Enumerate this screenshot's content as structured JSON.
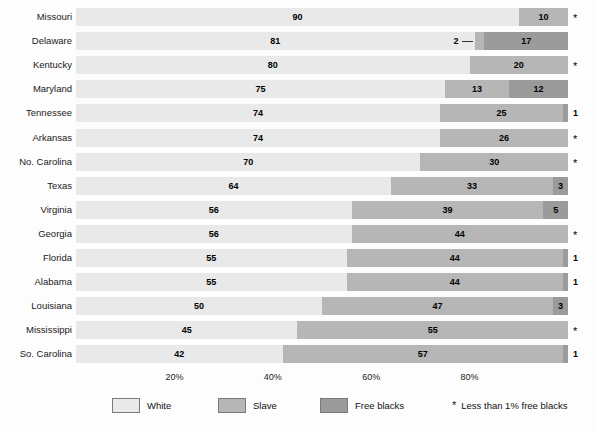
{
  "chart_data": {
    "type": "bar",
    "subtype": "stacked-horizontal-100pct",
    "title": "",
    "xlabel": "",
    "ylabel": "",
    "xlim": [
      0,
      100
    ],
    "grid": false,
    "legend_position": "bottom",
    "categories": [
      "Missouri",
      "Delaware",
      "Kentucky",
      "Maryland",
      "Tennessee",
      "Arkansas",
      "No. Carolina",
      "Texas",
      "Virginia",
      "Georgia",
      "Florida",
      "Alabama",
      "Louisiana",
      "Mississippi",
      "So. Carolina"
    ],
    "series": [
      {
        "name": "White",
        "color": "#e9e9e9",
        "values": [
          90,
          81,
          80,
          75,
          74,
          74,
          70,
          64,
          56,
          56,
          55,
          55,
          50,
          45,
          42
        ]
      },
      {
        "name": "Slave",
        "color": "#b6b6b6",
        "values": [
          10,
          2,
          20,
          13,
          25,
          26,
          30,
          33,
          39,
          44,
          44,
          44,
          47,
          55,
          57
        ]
      },
      {
        "name": "Free blacks",
        "color": "#9b9b9b",
        "values": [
          0,
          17,
          0,
          12,
          1,
          0,
          0,
          3,
          5,
          0,
          1,
          1,
          3,
          0,
          1
        ]
      }
    ],
    "x_ticks": [
      "20%",
      "40%",
      "60%",
      "80%"
    ],
    "x_tick_values": [
      20,
      40,
      60,
      80
    ],
    "rows": [
      {
        "label": "Missouri",
        "white": 90,
        "slave": 10,
        "free": 0,
        "white_label": "90",
        "slave_label": "10",
        "free_label": "",
        "end_marker": "*",
        "slave_callout": false
      },
      {
        "label": "Delaware",
        "white": 81,
        "slave": 2,
        "free": 17,
        "white_label": "81",
        "slave_label": "2",
        "free_label": "17",
        "end_marker": "",
        "slave_callout": true
      },
      {
        "label": "Kentucky",
        "white": 80,
        "slave": 20,
        "free": 0,
        "white_label": "80",
        "slave_label": "20",
        "free_label": "",
        "end_marker": "*",
        "slave_callout": false
      },
      {
        "label": "Maryland",
        "white": 75,
        "slave": 13,
        "free": 12,
        "white_label": "75",
        "slave_label": "13",
        "free_label": "12",
        "end_marker": "",
        "slave_callout": false
      },
      {
        "label": "Tennessee",
        "white": 74,
        "slave": 25,
        "free": 1,
        "white_label": "74",
        "slave_label": "25",
        "free_label": "",
        "end_marker": "1",
        "slave_callout": false
      },
      {
        "label": "Arkansas",
        "white": 74,
        "slave": 26,
        "free": 0,
        "white_label": "74",
        "slave_label": "26",
        "free_label": "",
        "end_marker": "*",
        "slave_callout": false
      },
      {
        "label": "No. Carolina",
        "white": 70,
        "slave": 30,
        "free": 0,
        "white_label": "70",
        "slave_label": "30",
        "free_label": "",
        "end_marker": "*",
        "slave_callout": false
      },
      {
        "label": "Texas",
        "white": 64,
        "slave": 33,
        "free": 3,
        "white_label": "64",
        "slave_label": "33",
        "free_label": "3",
        "end_marker": "",
        "slave_callout": false
      },
      {
        "label": "Virginia",
        "white": 56,
        "slave": 39,
        "free": 5,
        "white_label": "56",
        "slave_label": "39",
        "free_label": "5",
        "end_marker": "",
        "slave_callout": false
      },
      {
        "label": "Georgia",
        "white": 56,
        "slave": 44,
        "free": 0,
        "white_label": "56",
        "slave_label": "44",
        "free_label": "",
        "end_marker": "*",
        "slave_callout": false
      },
      {
        "label": "Florida",
        "white": 55,
        "slave": 44,
        "free": 1,
        "white_label": "55",
        "slave_label": "44",
        "free_label": "",
        "end_marker": "1",
        "slave_callout": false
      },
      {
        "label": "Alabama",
        "white": 55,
        "slave": 44,
        "free": 1,
        "white_label": "55",
        "slave_label": "44",
        "free_label": "",
        "end_marker": "1",
        "slave_callout": false
      },
      {
        "label": "Louisiana",
        "white": 50,
        "slave": 47,
        "free": 3,
        "white_label": "50",
        "slave_label": "47",
        "free_label": "3",
        "end_marker": "",
        "slave_callout": false
      },
      {
        "label": "Mississippi",
        "white": 45,
        "slave": 55,
        "free": 0,
        "white_label": "45",
        "slave_label": "55",
        "free_label": "",
        "end_marker": "*",
        "slave_callout": false
      },
      {
        "label": "So. Carolina",
        "white": 42,
        "slave": 57,
        "free": 1,
        "white_label": "42",
        "slave_label": "57",
        "free_label": "",
        "end_marker": "1",
        "slave_callout": false
      }
    ],
    "legend": [
      {
        "label": "White",
        "color": "#e9e9e9"
      },
      {
        "label": "Slave",
        "color": "#b6b6b6"
      },
      {
        "label": "Free blacks",
        "color": "#9b9b9b"
      }
    ],
    "footnote": {
      "marker": "*",
      "text": "Less than 1% free blacks"
    }
  }
}
